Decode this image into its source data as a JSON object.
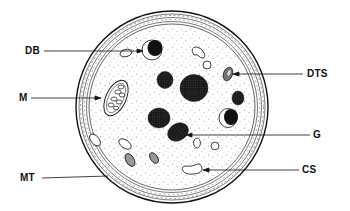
{
  "diagram": {
    "type": "cell-cross-section",
    "background": "#ffffff",
    "ink": "#111111",
    "labels": [
      {
        "id": "DB",
        "text": "DB",
        "side": "left"
      },
      {
        "id": "M",
        "text": "M",
        "side": "left"
      },
      {
        "id": "MT",
        "text": "MT",
        "side": "left"
      },
      {
        "id": "DTS",
        "text": "DTS",
        "side": "right"
      },
      {
        "id": "G",
        "text": "G",
        "side": "right"
      },
      {
        "id": "CS",
        "text": "CS",
        "side": "right"
      }
    ]
  }
}
